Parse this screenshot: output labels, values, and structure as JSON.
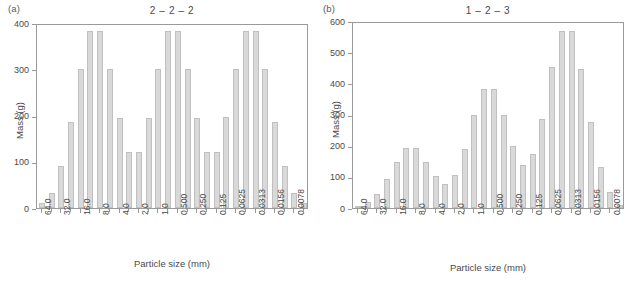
{
  "figure": {
    "panel_a_tag": "(a)",
    "panel_b_tag": "(b)",
    "xlabel": "Particle size (mm)",
    "ylabel": "Mass (g)",
    "bar_color": "#d9d9d9",
    "bar_edge_color": "#c0c0c0",
    "axis_color": "#9a9a9a",
    "text_color": "#4a4a4a"
  },
  "chart_data": [
    {
      "type": "bar",
      "panel": "(a)",
      "title": "2 – 2 – 2",
      "xlabel": "Particle size (mm)",
      "ylabel": "Mass (g)",
      "ylim": [
        0,
        400
      ],
      "yticks": [
        0,
        100,
        200,
        300,
        400
      ],
      "ytick_labels": [
        "0",
        "100",
        "200",
        "300",
        "400"
      ],
      "grid": false,
      "legend": "none",
      "tick_labels": [
        "64.0",
        "32.0",
        "16.0",
        "8.0",
        "4.0",
        "2.0",
        "1.0",
        "0.500",
        "0.250",
        "0.125",
        "0.0625",
        "0.0313",
        "0.0156",
        "0.0078"
      ],
      "n_bars": 28,
      "tick_every": 2,
      "values": [
        10,
        32,
        90,
        185,
        300,
        382,
        382,
        300,
        195,
        122,
        122,
        195,
        300,
        382,
        382,
        300,
        195,
        122,
        122,
        196,
        300,
        382,
        382,
        300,
        185,
        90,
        32,
        10
      ]
    },
    {
      "type": "bar",
      "panel": "(b)",
      "title": "1 – 2 – 3",
      "xlabel": "Particle size (mm)",
      "ylabel": "Mass (g)",
      "ylim": [
        0,
        600
      ],
      "yticks": [
        0,
        100,
        200,
        300,
        400,
        500,
        600
      ],
      "ytick_labels": [
        "0",
        "100",
        "200",
        "300",
        "400",
        "500",
        "600"
      ],
      "grid": false,
      "legend": "none",
      "tick_labels": [
        "64.0",
        "32.0",
        "16.0",
        "8.0",
        "4.0",
        "2.0",
        "1.0",
        "0.500",
        "0.250",
        "0.125",
        "0.0625",
        "0.0313",
        "0.0156",
        "0.0078"
      ],
      "n_bars": 28,
      "tick_every": 2,
      "values": [
        8,
        20,
        46,
        93,
        148,
        192,
        192,
        147,
        102,
        78,
        105,
        189,
        300,
        381,
        383,
        300,
        199,
        139,
        174,
        285,
        451,
        568,
        568,
        447,
        277,
        133,
        52,
        10
      ]
    }
  ]
}
